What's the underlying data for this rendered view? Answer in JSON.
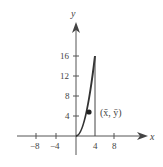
{
  "diagram": {
    "axes": {
      "x_label": "x",
      "y_label": "y",
      "x_ticks": [
        {
          "value": -8,
          "label": "−8"
        },
        {
          "value": -4,
          "label": "−4"
        },
        {
          "value": 4,
          "label": "4"
        },
        {
          "value": 8,
          "label": "8"
        }
      ],
      "y_ticks": [
        {
          "value": 4,
          "label": "4"
        },
        {
          "value": 8,
          "label": "8"
        },
        {
          "value": 12,
          "label": "12"
        },
        {
          "value": 16,
          "label": "16"
        }
      ]
    },
    "curve": {
      "equation": "y = x^2",
      "x_from": 0,
      "x_to": 4
    },
    "boundary_line": {
      "x": 4,
      "y_from": 0,
      "y_to": 16
    },
    "centroid": {
      "x": 3,
      "y": 4.8,
      "label": "(x̄, ȳ)"
    },
    "colors": {
      "ink": "#444444",
      "axis": "#555555"
    }
  }
}
